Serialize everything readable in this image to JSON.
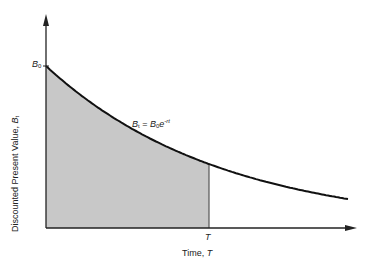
{
  "chart_data": {
    "type": "area",
    "title": "",
    "xlabel": "Time, T",
    "ylabel": "Discounted Present Value, B_t",
    "curve_label": "B_t = B_0 e^{-rt}",
    "y_tick_labels": [
      "B0"
    ],
    "x_tick_labels": [
      "T"
    ],
    "function": "exponential decay",
    "series": [
      {
        "name": "B_t = B_0 e^{-rt}",
        "x": [
          0,
          0.1,
          0.2,
          0.3,
          0.4,
          0.5,
          0.52,
          0.6,
          0.7,
          0.8,
          0.9,
          0.97
        ],
        "y": [
          1.0,
          0.84,
          0.71,
          0.6,
          0.51,
          0.43,
          0.41,
          0.36,
          0.3,
          0.26,
          0.22,
          0.19
        ]
      }
    ],
    "shaded_region": {
      "from": 0,
      "to": "T",
      "fill": "#c8c8c8"
    },
    "grid": false,
    "legend": "none"
  },
  "labels": {
    "b0": "B",
    "b0_sub": "0",
    "t_tick": "T",
    "x_axis_prefix": "Time, ",
    "x_axis_var": "T",
    "y_axis_prefix": "Discounted Present Value, ",
    "y_axis_var": "B",
    "y_axis_sub": "t",
    "eq_lhs": "B",
    "eq_lhs_sub": "t",
    "eq_mid": " = ",
    "eq_rhs": "B",
    "eq_rhs_sub": "0",
    "eq_e": "e",
    "eq_exp": "-rt"
  },
  "colors": {
    "axis": "#222222",
    "curve": "#111111",
    "shade": "#c8c8c8"
  }
}
